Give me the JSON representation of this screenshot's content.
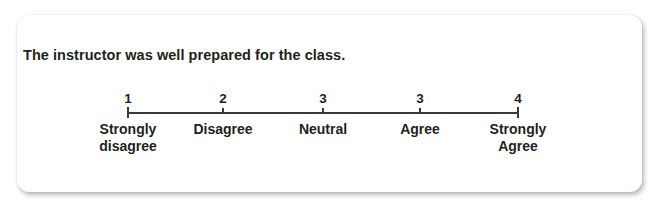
{
  "question": "The instructor was well prepared for the class.",
  "scale": {
    "points": [
      {
        "number": "1",
        "label_line1": "Strongly",
        "label_line2": "disagree",
        "x": 128
      },
      {
        "number": "2",
        "label_line1": "Disagree",
        "label_line2": "",
        "x": 223
      },
      {
        "number": "3",
        "label_line1": "Neutral",
        "label_line2": "",
        "x": 323
      },
      {
        "number": "3",
        "label_line1": "Agree",
        "label_line2": "",
        "x": 420
      },
      {
        "number": "4",
        "label_line1": "Strongly",
        "label_line2": "Agree",
        "x": 518
      }
    ]
  },
  "colors": {
    "text": "#231f20",
    "line": "#3a3a3a",
    "card_background": "#ffffff"
  }
}
